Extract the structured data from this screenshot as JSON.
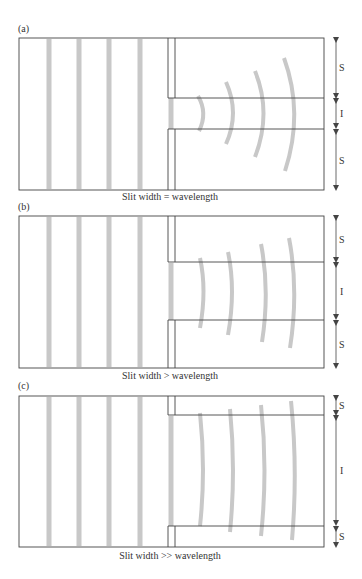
{
  "colors": {
    "frame": "#444444",
    "wave": "#c8c8c8",
    "text": "#333333"
  },
  "panels": [
    {
      "label": "(a)",
      "caption": "Slit width = wavelength",
      "dimensions": [
        "S",
        "I",
        "S"
      ]
    },
    {
      "label": "(b)",
      "caption": "Slit width > wavelength",
      "dimensions": [
        "S",
        "I",
        "S"
      ]
    },
    {
      "label": "(c)",
      "caption": "Slit width >> wavelength",
      "dimensions": [
        "S",
        "I",
        "S"
      ]
    }
  ]
}
